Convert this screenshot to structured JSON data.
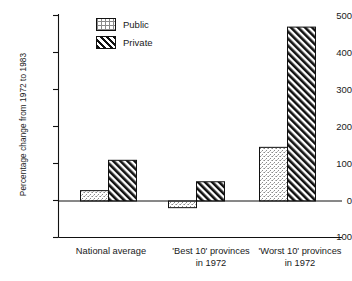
{
  "chart_data": {
    "type": "bar",
    "title": "",
    "subtitle": "",
    "xlabel": "",
    "ylabel": "Percentage change from 1972 to 1983",
    "categories": [
      "National average",
      "'Best 10' provinces\nin 1972",
      "'Worst 10' provinces\nin 1972"
    ],
    "series": [
      {
        "name": "Public",
        "values": [
          28,
          -18,
          145
        ]
      },
      {
        "name": "Private",
        "values": [
          110,
          52,
          470
        ]
      }
    ],
    "ylim": [
      -100,
      500
    ],
    "yticks": [
      -100,
      0,
      100,
      200,
      300,
      400,
      500
    ],
    "ytick_labels": [
      "-100",
      "0",
      "100",
      "200",
      "300",
      "400",
      "500"
    ],
    "grid": false,
    "legend_position": "top-center",
    "zero_line": true
  },
  "legend": {
    "items": [
      {
        "label": "Public",
        "pattern": "dotted-stipple"
      },
      {
        "label": "Private",
        "pattern": "diagonal-hatch"
      }
    ]
  },
  "colors": {
    "axis": "#111111",
    "public_fill": "#f2f2f2",
    "private_fill": "#ffffff",
    "hatch": "#111111",
    "text": "#1a1a1a"
  }
}
